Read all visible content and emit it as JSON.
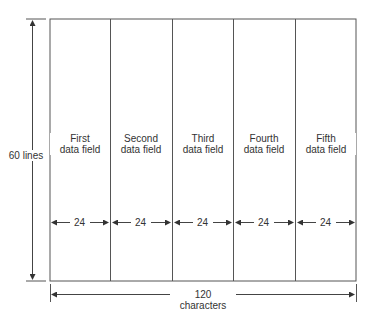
{
  "diagram": {
    "height_label": "60 lines",
    "width_label": "120 characters",
    "fields": [
      {
        "line1": "First",
        "line2": "data field",
        "width": "24"
      },
      {
        "line1": "Second",
        "line2": "data field",
        "width": "24"
      },
      {
        "line1": "Third",
        "line2": "data field",
        "width": "24"
      },
      {
        "line1": "Fourth",
        "line2": "data field",
        "width": "24"
      },
      {
        "line1": "Fifth",
        "line2": "data field",
        "width": "24"
      }
    ],
    "line_color": "#444444"
  }
}
